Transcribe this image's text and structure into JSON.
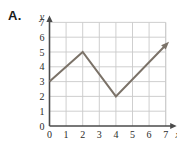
{
  "figure": {
    "problem_label": "A.",
    "background_color": "#ffffff"
  },
  "chart_data": {
    "type": "line",
    "title": "",
    "subtitle": "",
    "xlabel": "x",
    "ylabel": "y",
    "xlim": [
      0,
      7.6
    ],
    "ylim": [
      0,
      7.4
    ],
    "xticks": [
      "0",
      "1",
      "2",
      "3",
      "4",
      "5",
      "6",
      "7"
    ],
    "yticks": [
      "0",
      "1",
      "2",
      "3",
      "4",
      "5",
      "6",
      "7"
    ],
    "xtick_values": [
      0,
      1,
      2,
      3,
      4,
      5,
      6,
      7
    ],
    "ytick_values": [
      0,
      1,
      2,
      3,
      4,
      5,
      6,
      7
    ],
    "grid": true,
    "grid_color": "#c9c9c9",
    "axis_color": "#4a4a4a",
    "legend": null,
    "legend_position": "none",
    "series": [
      {
        "name": "piecewise-path",
        "color": "#7b7268",
        "line_width": 2,
        "arrow_end": true,
        "x": [
          0,
          2,
          4,
          7.2
        ],
        "y": [
          3,
          5,
          2,
          5.7
        ],
        "points": [
          {
            "x": 0,
            "y": 3,
            "label": "start"
          },
          {
            "x": 2,
            "y": 5,
            "label": "peak"
          },
          {
            "x": 4,
            "y": 2,
            "label": "valley"
          },
          {
            "x": 7.2,
            "y": 5.7,
            "label": "arrow-end"
          }
        ]
      }
    ],
    "annotations": []
  }
}
